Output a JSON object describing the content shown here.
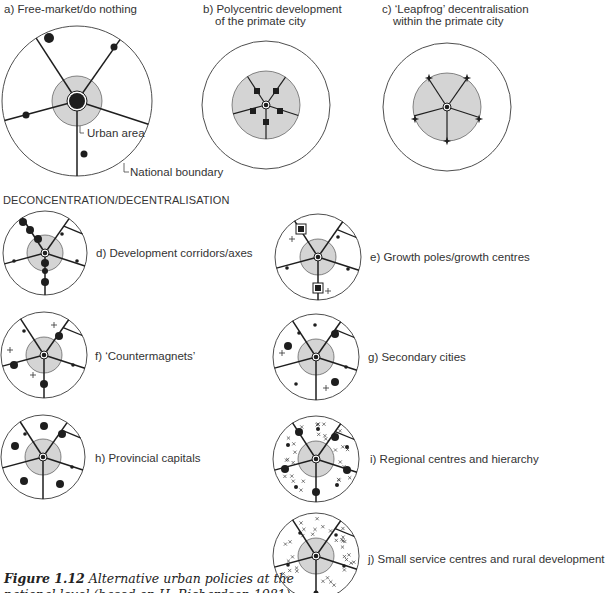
{
  "colors": {
    "line": "#1e1e1e",
    "urban_fill": "#d4d4d4",
    "boundary": "#3a3a3a",
    "bg": "#ffffff"
  },
  "top_row": {
    "a": {
      "title": "a) Free-market/do nothing",
      "callout_urban": "Urban area",
      "callout_boundary": "National boundary"
    },
    "b": {
      "title_line1": "b) Polycentric development",
      "title_line2": "of the primate city"
    },
    "c": {
      "title_line1": "c) ‘Leapfrog’ decentralisation",
      "title_line2": "within the primate city"
    }
  },
  "section_heading": "DECONCENTRATION/DECENTRALISATION",
  "panels": [
    {
      "id": "d",
      "label": "d) Development corridors/axes"
    },
    {
      "id": "e",
      "label": "e) Growth poles/growth centres"
    },
    {
      "id": "f",
      "label": "f) ‘Countermagnets’"
    },
    {
      "id": "g",
      "label": "g) Secondary cities"
    },
    {
      "id": "h",
      "label": "h) Provincial capitals"
    },
    {
      "id": "i",
      "label": "i) Regional centres and hierarchy"
    },
    {
      "id": "j",
      "label": "j) Small service centres and rural development"
    }
  ],
  "caption": {
    "figure_no": "Figure 1.12",
    "text_line1": "Alternative urban policies at the",
    "text_line2": "national level (based on H. Richardson 1981)"
  },
  "geometry": {
    "spokes": [
      [
        -30,
        -1.02
      ],
      [
        32,
        -1.0
      ],
      [
        -105,
        0.2
      ],
      [
        100,
        0.5
      ],
      [
        0,
        1.0
      ]
    ],
    "diagrams": {
      "a": {
        "cx": 77,
        "cy": 101,
        "r": 75,
        "ur": 25,
        "spokes": "wide",
        "dots": [
          [
            -28,
            -63,
            5
          ],
          [
            37,
            -54,
            3.5
          ],
          [
            -51,
            14,
            3.5
          ],
          [
            7,
            53,
            3.5
          ]
        ],
        "core": 8
      },
      "b": {
        "cx": 266,
        "cy": 105,
        "r": 64,
        "ur": 34,
        "spokes": "inner",
        "squares": [
          [
            -9,
            -14
          ],
          [
            10,
            -14
          ],
          [
            -13,
            6
          ],
          [
            14,
            6
          ],
          [
            0,
            17
          ]
        ]
      },
      "c": {
        "cx": 447,
        "cy": 107,
        "r": 64,
        "ur": 34,
        "spokes": "inner",
        "stars": [
          [
            -18,
            -29
          ],
          [
            20,
            -29
          ],
          [
            -32,
            12
          ],
          [
            32,
            12
          ],
          [
            0,
            34
          ]
        ]
      },
      "d": {
        "cx": 45,
        "cy": 253,
        "r": 42,
        "ur": 18,
        "dots": [
          [
            -22,
            -31,
            4
          ],
          [
            -15,
            -23,
            4
          ],
          [
            -7,
            -14,
            4
          ],
          [
            0,
            10,
            4
          ],
          [
            0,
            18,
            3
          ],
          [
            0,
            29,
            4
          ],
          [
            -31,
            8,
            1.8
          ],
          [
            32,
            8,
            1.8
          ],
          [
            17,
            -19,
            1.8
          ]
        ]
      },
      "e": {
        "cx": 318,
        "cy": 257,
        "r": 43,
        "ur": 18,
        "gsquares": [
          [
            -17,
            -28
          ],
          [
            0,
            31
          ]
        ],
        "dots": [
          [
            20,
            -20,
            1.8
          ],
          [
            -31,
            11,
            1.8
          ],
          [
            30,
            12,
            1.8
          ]
        ],
        "plus": [
          [
            -26,
            -18
          ],
          [
            10,
            34
          ]
        ]
      },
      "f": {
        "cx": 44,
        "cy": 355,
        "r": 43,
        "ur": 18,
        "dots": [
          [
            15,
            -19,
            4
          ],
          [
            -30,
            10,
            4
          ],
          [
            0,
            29,
            4
          ],
          [
            -20,
            -24,
            1.8
          ],
          [
            29,
            10,
            1.8
          ]
        ],
        "plus": [
          [
            10,
            -30
          ],
          [
            -34,
            -5
          ],
          [
            -11,
            20
          ]
        ]
      },
      "g": {
        "cx": 316,
        "cy": 357,
        "r": 43,
        "ur": 18,
        "dots": [
          [
            -1,
            -32,
            1.8
          ],
          [
            19,
            -23,
            4
          ],
          [
            -28,
            -11,
            4
          ],
          [
            -20,
            27,
            1.8
          ],
          [
            19,
            25,
            4
          ],
          [
            -17,
            -24,
            1.8
          ],
          [
            30,
            10,
            1.8
          ]
        ],
        "plus": [
          [
            -34,
            -4
          ],
          [
            10,
            31
          ]
        ]
      },
      "h": {
        "cx": 43,
        "cy": 457,
        "r": 42,
        "ur": 18,
        "dots": [
          [
            1,
            -31,
            4
          ],
          [
            19,
            -23,
            4
          ],
          [
            -28,
            -11,
            4
          ],
          [
            -19,
            24,
            4
          ],
          [
            17,
            27,
            4
          ],
          [
            -18,
            -23,
            1.8
          ],
          [
            29,
            10,
            1.8
          ]
        ]
      },
      "i": {
        "cx": 316,
        "cy": 459,
        "r": 43,
        "ur": 18,
        "cross_field": true,
        "dots": [
          [
            -17,
            -27,
            4
          ],
          [
            19,
            -22,
            4
          ],
          [
            -31,
            10,
            4
          ],
          [
            31,
            11,
            4
          ],
          [
            0,
            33,
            4
          ],
          [
            2,
            -30,
            2
          ],
          [
            -28,
            -14,
            2
          ],
          [
            31,
            -12,
            2
          ],
          [
            -20,
            28,
            2
          ],
          [
            21,
            26,
            2
          ]
        ]
      },
      "j": {
        "cx": 316,
        "cy": 556,
        "r": 43,
        "ur": 18,
        "cross_field": true,
        "dots": [
          [
            -16,
            -23,
            1.8
          ],
          [
            20,
            -21,
            1.8
          ],
          [
            -28,
            9,
            1.8
          ],
          [
            28,
            10,
            1.8
          ],
          [
            0,
            37,
            2.5
          ]
        ]
      }
    },
    "panel_layout": {
      "d": {
        "lx": 96,
        "ly": 247
      },
      "e": {
        "lx": 370,
        "ly": 251
      },
      "f": {
        "lx": 95,
        "ly": 350
      },
      "g": {
        "lx": 368,
        "ly": 351
      },
      "h": {
        "lx": 95,
        "ly": 452
      },
      "i": {
        "lx": 370,
        "ly": 453
      },
      "j": {
        "lx": 368,
        "ly": 553
      }
    }
  }
}
